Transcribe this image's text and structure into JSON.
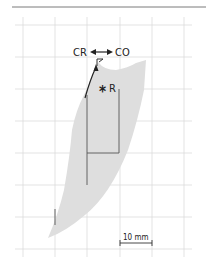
{
  "figure": {
    "labels": {
      "left_direction": "CR",
      "right_direction": "CO",
      "reference_point": "R",
      "point_marker": "P"
    },
    "scale_bar": {
      "label": "10 mm"
    },
    "icons": {
      "reference_marker": "asterisk-icon",
      "direction_arrow": "double-headed-arrow-icon"
    },
    "colors": {
      "grid": "#d8d8d8",
      "region_fill": "#dcdcdc",
      "lines": "#444444",
      "top_rule": "#777777"
    }
  }
}
